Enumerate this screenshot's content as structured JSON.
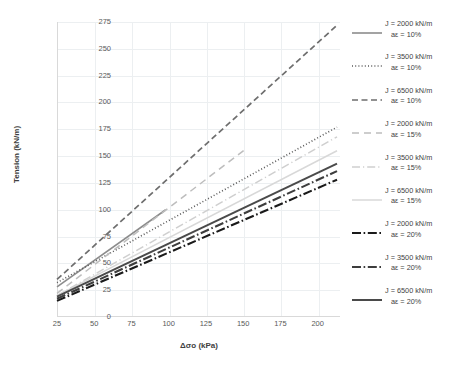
{
  "chart_data": {
    "type": "line",
    "title": "",
    "xlabel": "Δσo (kPa)",
    "ylabel": "Tension (kN/m)",
    "xlim": [
      25,
      215
    ],
    "ylim": [
      0,
      275
    ],
    "xticks": [
      25,
      50,
      75,
      100,
      125,
      150,
      175,
      200
    ],
    "yticks": [
      0,
      25,
      50,
      75,
      100,
      125,
      150,
      175,
      200,
      225,
      250,
      275
    ],
    "grid": true,
    "legend_position": "right",
    "series": [
      {
        "name": "J = 2000 kN/m aE = 10%",
        "label_line1": "J = 2000 kN/m",
        "label_line2": "aε = 10%",
        "style": "solid",
        "color": "#8c8c8c",
        "width": 1.6,
        "x": [
          25,
          98
        ],
        "y": [
          28,
          100
        ]
      },
      {
        "name": "J = 3500 kN/m aE = 10%",
        "label_line1": "J = 3500 kN/m",
        "label_line2": "aε = 10%",
        "style": "dotted",
        "color": "#5a5a5a",
        "width": 1.6,
        "x": [
          25,
          213
        ],
        "y": [
          32,
          177
        ]
      },
      {
        "name": "J = 6500 kN/m aE = 10%",
        "label_line1": "J = 6500 kN/m",
        "label_line2": "aε = 10%",
        "style": "dashed",
        "color": "#6e6e6e",
        "width": 1.7,
        "x": [
          25,
          213
        ],
        "y": [
          35,
          272
        ]
      },
      {
        "name": "J = 2000 kN/m aE = 15%",
        "label_line1": "J = 2000 kN/m",
        "label_line2": "aε = 15%",
        "style": "longdash",
        "color": "#bdbdbd",
        "width": 1.5,
        "x": [
          25,
          152
        ],
        "y": [
          22,
          157
        ]
      },
      {
        "name": "J = 3500 kN/m aE = 15%",
        "label_line1": "J = 3500 kN/m",
        "label_line2": "aε = 15%",
        "style": "dashdotlight",
        "color": "#cfcfcf",
        "width": 1.5,
        "x": [
          25,
          213
        ],
        "y": [
          20,
          168
        ]
      },
      {
        "name": "J = 6500 kN/m aE = 15%",
        "label_line1": "J = 6500 kN/m",
        "label_line2": "aε = 15%",
        "style": "solidlight",
        "color": "#d8d8d8",
        "width": 1.5,
        "x": [
          25,
          213
        ],
        "y": [
          20,
          155
        ]
      },
      {
        "name": "J = 2000 kN/m aE = 20%",
        "label_line1": "J = 2000 kN/m",
        "label_line2": "aε = 20%",
        "style": "dashdotheavy",
        "color": "#1a1a1a",
        "width": 2.1,
        "x": [
          25,
          213
        ],
        "y": [
          15,
          128
        ]
      },
      {
        "name": "J = 3500 kN/m aE = 20%",
        "label_line1": "J = 3500 kN/m",
        "label_line2": "aε = 20%",
        "style": "dashdotheavy2",
        "color": "#3d3d3d",
        "width": 2.1,
        "x": [
          25,
          213
        ],
        "y": [
          17,
          136
        ]
      },
      {
        "name": "J = 6500 kN/m aE = 20%",
        "label_line1": "J = 6500 kN/m",
        "label_line2": "aε = 20%",
        "style": "solidheavy",
        "color": "#4a4a4a",
        "width": 2.0,
        "x": [
          25,
          213
        ],
        "y": [
          19,
          143
        ]
      }
    ]
  },
  "axes": {
    "xlabel": "Δσo (kPa)",
    "ylabel": "Tension (kN/m)"
  },
  "legend": {
    "items": [
      {
        "line1": "J = 2000 kN/m",
        "line2": "aε = 10%"
      },
      {
        "line1": "J = 3500 kN/m",
        "line2": "aε = 10%"
      },
      {
        "line1": "J = 6500 kN/m",
        "line2": "aε = 10%"
      },
      {
        "line1": "J = 2000 kN/m",
        "line2": "aε = 15%"
      },
      {
        "line1": "J = 3500 kN/m",
        "line2": "aε = 15%"
      },
      {
        "line1": "J = 6500 kN/m",
        "line2": "aε = 15%"
      },
      {
        "line1": "J = 2000 kN/m",
        "line2": "aε = 20%"
      },
      {
        "line1": "J = 3500 kN/m",
        "line2": "aε = 20%"
      },
      {
        "line1": "J = 6500 kN/m",
        "line2": "aε = 20%"
      }
    ]
  },
  "colors": {
    "background": "#ffffff",
    "grid": "#eceff1",
    "axis": "#d9d9d9",
    "tick_text": "#595959",
    "label_text": "#404040"
  }
}
